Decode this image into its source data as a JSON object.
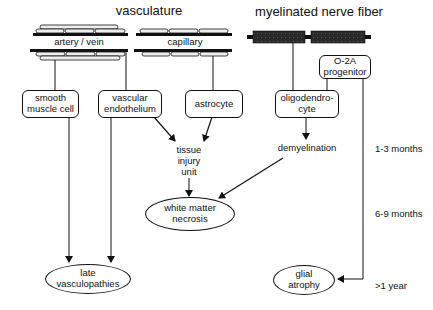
{
  "headings": {
    "vasculature": "vasculature",
    "nerve": "myelinated nerve fiber"
  },
  "vessels": {
    "artery": "artery / vein",
    "capillary": "capillary"
  },
  "boxes": {
    "smooth_muscle": [
      "smooth",
      "muscle cell"
    ],
    "endothelium": [
      "vascular",
      "endothelium"
    ],
    "astrocyte": [
      "astrocyte"
    ],
    "oligodendrocyte": [
      "oligodendro-",
      "cyte"
    ],
    "o2a": [
      "O-2A",
      "progenitor"
    ]
  },
  "intermediates": {
    "tissue_injury": [
      "tissue",
      "injury",
      "unit"
    ],
    "demyelination": "demyelination"
  },
  "outcomes": {
    "white_matter": [
      "white matter",
      "necrosis"
    ],
    "vasculopathies": [
      "late",
      "vasculopathies"
    ],
    "glial_atrophy": [
      "glial",
      "atrophy"
    ]
  },
  "timeline": {
    "t1": "1-3  months",
    "t2": "6-9  months",
    "t3": ">1  year"
  }
}
